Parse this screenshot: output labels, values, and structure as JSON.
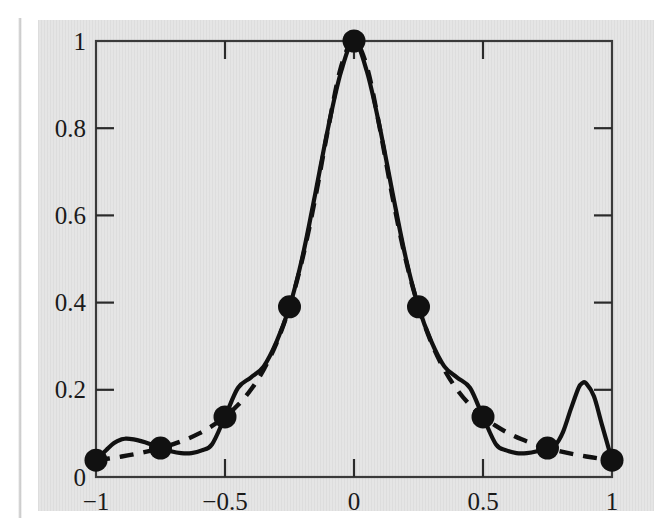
{
  "figure": {
    "caption": "",
    "background_color": "#e4e4e4",
    "ink_color": "#111111"
  },
  "chart_data": {
    "type": "line",
    "title": "",
    "xlabel": "",
    "ylabel": "",
    "xlim": [
      -1,
      1
    ],
    "ylim": [
      0,
      1
    ],
    "grid": false,
    "legend": "none",
    "x_ticks": [
      -1,
      -0.5,
      0,
      0.5,
      1
    ],
    "x_tick_labels": [
      "−1",
      "−0.5",
      "0",
      "0.5",
      "1"
    ],
    "y_ticks": [
      0,
      0.2,
      0.4,
      0.6,
      0.8,
      1
    ],
    "y_tick_labels": [
      "0",
      "0.2",
      "0.4",
      "0.6",
      "0.8",
      "1"
    ],
    "series": [
      {
        "name": "Runge function 1/(1+25x^2)",
        "style": "dashed",
        "color": "#111111",
        "x": [
          -1,
          -0.95,
          -0.9,
          -0.85,
          -0.8,
          -0.75,
          -0.7,
          -0.65,
          -0.6,
          -0.55,
          -0.5,
          -0.45,
          -0.4,
          -0.35,
          -0.3,
          -0.25,
          -0.2,
          -0.15,
          -0.1,
          -0.05,
          0,
          0.05,
          0.1,
          0.15,
          0.2,
          0.25,
          0.3,
          0.35,
          0.4,
          0.45,
          0.5,
          0.55,
          0.6,
          0.65,
          0.7,
          0.75,
          0.8,
          0.85,
          0.9,
          0.95,
          1
        ],
        "values": [
          0.0385,
          0.0425,
          0.0471,
          0.0525,
          0.0588,
          0.0664,
          0.0754,
          0.0864,
          0.1,
          0.1171,
          0.1379,
          0.1649,
          0.2,
          0.2462,
          0.3077,
          0.3902,
          0.5,
          0.64,
          0.8,
          0.9412,
          1.0,
          0.9412,
          0.8,
          0.64,
          0.5,
          0.3902,
          0.3077,
          0.2462,
          0.2,
          0.1649,
          0.1379,
          0.1171,
          0.1,
          0.0864,
          0.0754,
          0.0664,
          0.0588,
          0.0525,
          0.0471,
          0.0425,
          0.0385
        ]
      },
      {
        "name": "Degree-8 polynomial interpolant on 9 equispaced nodes",
        "style": "solid",
        "color": "#111111",
        "x": [
          -1,
          -0.96,
          -0.93,
          -0.9,
          -0.885,
          -0.87,
          -0.84,
          -0.81,
          -0.78,
          -0.75,
          -0.71,
          -0.67,
          -0.63,
          -0.59,
          -0.55,
          -0.5,
          -0.45,
          -0.4,
          -0.35,
          -0.3,
          -0.25,
          -0.2,
          -0.15,
          -0.1,
          -0.05,
          0,
          0.05,
          0.1,
          0.15,
          0.2,
          0.25,
          0.3,
          0.35,
          0.4,
          0.45,
          0.5,
          0.55,
          0.59,
          0.63,
          0.67,
          0.71,
          0.75,
          0.78,
          0.81,
          0.84,
          0.87,
          0.885,
          0.9,
          0.93,
          0.96,
          1
        ],
        "values": [
          0.0385,
          0.062,
          0.078,
          0.0865,
          0.0878,
          0.0874,
          0.0845,
          0.0797,
          0.0733,
          0.0664,
          0.0592,
          0.0549,
          0.0549,
          0.061,
          0.0752,
          0.1379,
          0.2041,
          0.2281,
          0.2537,
          0.3104,
          0.3902,
          0.5043,
          0.6501,
          0.802,
          0.9301,
          1.0,
          0.9301,
          0.802,
          0.6501,
          0.5043,
          0.3902,
          0.3104,
          0.2537,
          0.2281,
          0.2041,
          0.1379,
          0.0752,
          0.061,
          0.0549,
          0.0549,
          0.0592,
          0.0664,
          0.0733,
          0.103,
          0.155,
          0.204,
          0.2155,
          0.2145,
          0.185,
          0.122,
          0.0385
        ]
      }
    ],
    "markers": {
      "name": "Interpolation nodes",
      "shape": "filled-circle",
      "color": "#111111",
      "x": [
        -1,
        -0.75,
        -0.5,
        -0.25,
        0,
        0.25,
        0.5,
        0.75,
        1
      ],
      "values": [
        0.0385,
        0.0664,
        0.1379,
        0.3902,
        1.0,
        0.3902,
        0.1379,
        0.0664,
        0.0385
      ]
    },
    "annotations": [
      {
        "label": "left interpolant overshoot",
        "x": -0.885,
        "y": 0.088
      },
      {
        "label": "right interpolant overshoot",
        "x": 0.89,
        "y": 0.215
      }
    ]
  }
}
